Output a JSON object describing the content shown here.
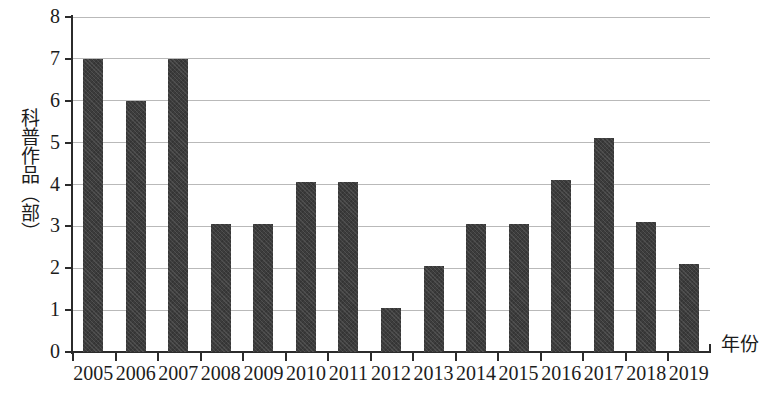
{
  "chart_data": {
    "type": "bar",
    "title": "",
    "subtitle": "",
    "xlabel": "年份",
    "ylabel": "科普作品（部）",
    "categories": [
      "2005",
      "2006",
      "2007",
      "2008",
      "2009",
      "2010",
      "2011",
      "2012",
      "2013",
      "2014",
      "2015",
      "2016",
      "2017",
      "2018",
      "2019"
    ],
    "values": [
      7.0,
      6.0,
      7.0,
      3.05,
      3.05,
      4.05,
      4.05,
      1.05,
      2.05,
      3.05,
      3.05,
      4.1,
      5.1,
      3.1,
      2.1
    ],
    "series": [
      {
        "name": "科普作品",
        "values": [
          7.0,
          6.0,
          7.0,
          3.05,
          3.05,
          4.05,
          4.05,
          1.05,
          2.05,
          3.05,
          3.05,
          4.1,
          5.1,
          3.1,
          2.1
        ]
      }
    ],
    "ylim": [
      0,
      8
    ],
    "yticks": [
      0,
      1,
      2,
      3,
      4,
      5,
      6,
      7,
      8
    ],
    "ytick_labels": [
      "0",
      "1",
      "2",
      "3",
      "4",
      "5",
      "6",
      "7",
      "8"
    ],
    "grid": true,
    "grid_axis": "y",
    "legend": false,
    "legend_position": "none",
    "bar_color": "#3c3c3c",
    "gridline_color": "#b9b9b9",
    "axis_color": "#2b2b2b",
    "background_color": "#ffffff"
  },
  "axes": {
    "y_title": "科普作品（部）",
    "x_title": "年份"
  },
  "artifacts": {
    "bottom_text": ""
  }
}
